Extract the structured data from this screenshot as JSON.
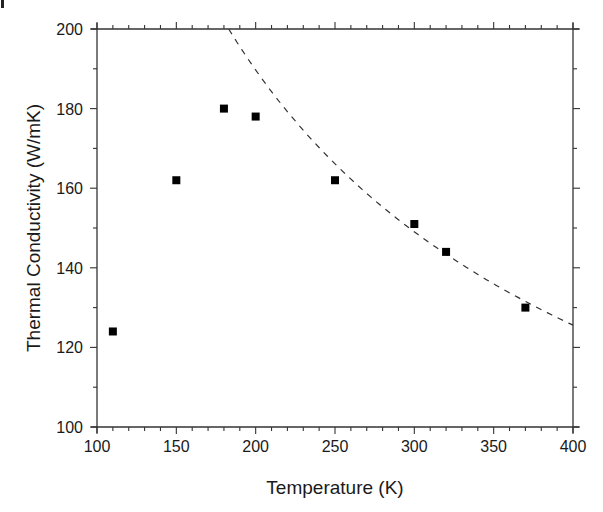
{
  "chart_data": {
    "type": "scatter",
    "title": "",
    "xlabel": "Temperature (K)",
    "ylabel": "Thermal Conductivity (W/mK)",
    "xlim": [
      100,
      400
    ],
    "ylim": [
      100,
      200
    ],
    "grid": false,
    "legend": null,
    "x_ticks": [
      100,
      150,
      200,
      250,
      300,
      350,
      400
    ],
    "x_tick_labels": [
      "100",
      "150",
      "200",
      "250",
      "300",
      "350",
      "400"
    ],
    "x_minor_step": 10,
    "y_ticks": [
      100,
      120,
      140,
      160,
      180,
      200
    ],
    "y_tick_labels": [
      "100",
      "120",
      "140",
      "160",
      "180",
      "200"
    ],
    "y_minor_step": 10,
    "series": [
      {
        "name": "Measured",
        "style": "markers",
        "marker": "square",
        "color": "#000000",
        "x": [
          110,
          150,
          180,
          200,
          250,
          300,
          320,
          370
        ],
        "y": [
          124,
          162,
          180,
          178,
          162,
          151,
          144,
          130
        ]
      },
      {
        "name": "Fit",
        "style": "dashed-line",
        "color": "#333333",
        "equation": "k = 200 * (T/183)^-0.595",
        "x": [
          183,
          200,
          225,
          250,
          275,
          300,
          325,
          350,
          375,
          400
        ],
        "y": [
          200,
          189.8,
          177.6,
          166.5,
          157.8,
          149.5,
          142.3,
          136.0,
          130.5,
          125.6
        ]
      }
    ]
  }
}
